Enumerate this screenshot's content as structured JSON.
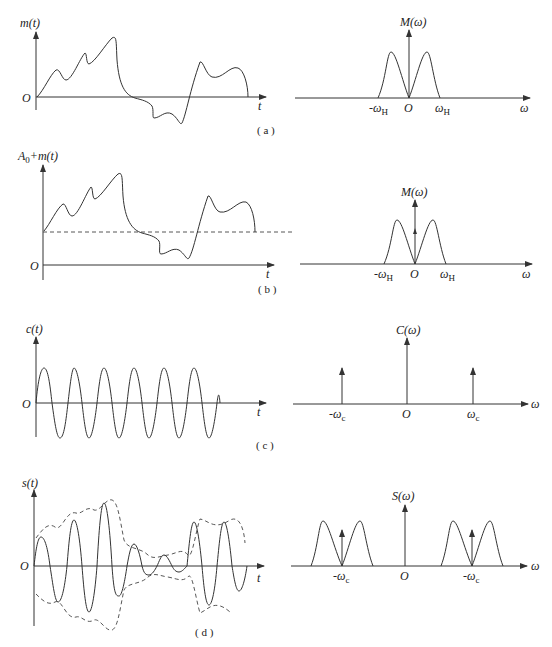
{
  "figure": {
    "panels": [
      {
        "id": "a",
        "caption": "( a )",
        "time_plot": {
          "ylabel": "m(t)",
          "xlabel": "t",
          "origin": "O"
        },
        "spectrum_plot": {
          "ylabel": "M(ω)",
          "xlabel": "ω",
          "origin": "O",
          "left_tick": "-ω",
          "left_tick_sub": "H",
          "right_tick": "ω",
          "right_tick_sub": "H"
        }
      },
      {
        "id": "b",
        "caption": "( b )",
        "time_plot": {
          "ylabel": "A",
          "ylabel_sub": "0",
          "ylabel_rest": "+m(t)",
          "xlabel": "t",
          "origin": "O"
        },
        "spectrum_plot": {
          "ylabel": "M(ω)",
          "xlabel": "ω",
          "origin": "O",
          "left_tick": "-ω",
          "left_tick_sub": "H",
          "right_tick": "ω",
          "right_tick_sub": "H"
        }
      },
      {
        "id": "c",
        "caption": "( c )",
        "time_plot": {
          "ylabel": "c(t)",
          "xlabel": "t",
          "origin": "O"
        },
        "spectrum_plot": {
          "ylabel": "C(ω)",
          "xlabel": "ω",
          "origin": "O",
          "left_tick": "-ω",
          "left_tick_sub": "c",
          "right_tick": "ω",
          "right_tick_sub": "c"
        }
      },
      {
        "id": "d",
        "caption": "( d )",
        "time_plot": {
          "ylabel": "s(t)",
          "xlabel": "t",
          "origin": "O"
        },
        "spectrum_plot": {
          "ylabel": "S(ω)",
          "xlabel": "ω",
          "origin": "O",
          "left_tick": "-ω",
          "left_tick_sub": "c",
          "right_tick": "-ω",
          "right_tick_sub": "c"
        }
      }
    ]
  }
}
